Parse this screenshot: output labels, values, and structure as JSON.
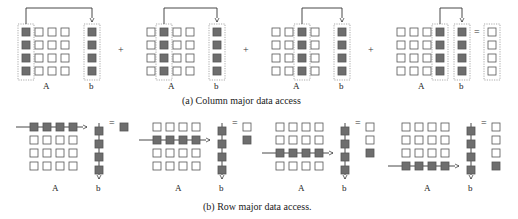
{
  "colors": {
    "filled": "#6e6e6e",
    "empty_fill": "#ffffff",
    "cell_stroke": "#555555",
    "line": "#333333",
    "dotted": "#888888"
  },
  "column_major": {
    "caption": "(a) Column major data access",
    "matrix_label": "A",
    "vector_label": "b",
    "operators": [
      "+",
      "+",
      "+",
      "="
    ],
    "panels": [
      {
        "x": 22,
        "active_col": 0,
        "b_x": 88
      },
      {
        "x": 147,
        "active_col": 1,
        "b_x": 213
      },
      {
        "x": 272,
        "active_col": 2,
        "b_x": 338
      },
      {
        "x": 397,
        "active_col": 3,
        "b_x": 458,
        "result_x": 488
      }
    ]
  },
  "row_major": {
    "caption": "(b) Row major data access.",
    "matrix_label": "A",
    "vector_label": "b",
    "operator": "=",
    "panels": [
      {
        "x": 30,
        "active_row": 0,
        "b_x": 95,
        "result_x": 120
      },
      {
        "x": 153,
        "active_row": 1,
        "b_x": 218,
        "result_x": 243
      },
      {
        "x": 276,
        "active_row": 2,
        "b_x": 341,
        "result_x": 366
      },
      {
        "x": 402,
        "active_row": 3,
        "b_x": 467,
        "result_x": 492
      }
    ]
  }
}
